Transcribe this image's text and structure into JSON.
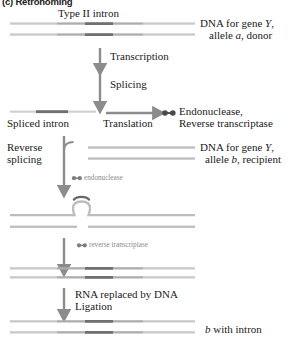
{
  "figure": {
    "panel_label": "(c) Retrohoming",
    "type": "biology-process-diagram"
  },
  "labels": {
    "type_ii_intron": "Type II intron",
    "donor_dna_line1": "DNA for gene Y,",
    "donor_dna_line2": "allele a, donor",
    "transcription": "Transcription",
    "splicing": "Splicing",
    "spliced_intron": "Spliced intron",
    "translation": "Translation",
    "enzymes_line1": "Endonuclease,",
    "enzymes_line2": "Reverse transcriptase",
    "reverse_splicing_line1": "Reverse",
    "reverse_splicing_line2": "splicing",
    "recipient_dna_line1": "DNA for gene Y,",
    "recipient_dna_line2": "allele b, recipient",
    "endonuclease_small": "endonuclease",
    "reverse_transcriptase_small": "reverse transcriptase",
    "rna_replaced_line1": "RNA replaced by DNA",
    "rna_replaced_line2": "Ligation",
    "final_product": "b with intron"
  },
  "italics": {
    "gene_Y": "Y",
    "allele_a": "a",
    "allele_b": "b",
    "final_b": "b"
  },
  "icons": {
    "protein_enzyme": "dumbbell-icon",
    "arrow_down": "arrow-down-icon",
    "arrow_right": "arrow-right-icon",
    "branch_arrow": "curved-branch-arrow-icon",
    "intron_loop": "lariat-loop-icon"
  },
  "colors": {
    "exon_light": "#c9c9c9",
    "exon_mid": "#aaaaaa",
    "intron_dark": "#707070",
    "strand_plain": "#bdbdbd",
    "arrow": "#8c8c8c",
    "text": "#1a1a1a",
    "text_muted": "#8a8a8a",
    "background": "#ffffff"
  },
  "diagram_steps": [
    {
      "step": 1,
      "name": "donor-dna",
      "description": "Double-stranded donor DNA containing Type II intron"
    },
    {
      "step": 2,
      "name": "transcription",
      "description": "Transcription of intron-containing gene"
    },
    {
      "step": 3,
      "name": "splicing",
      "description": "Splicing releases the intron"
    },
    {
      "step": 4,
      "name": "spliced-intron",
      "description": "Free spliced intron RNA"
    },
    {
      "step": 5,
      "name": "translation",
      "description": "Translation produces endonuclease and reverse transcriptase"
    },
    {
      "step": 6,
      "name": "reverse-splicing",
      "description": "Intron reverse-splices into recipient allele b DNA"
    },
    {
      "step": 7,
      "name": "endonuclease-cut",
      "description": "Endonuclease cuts the bottom strand"
    },
    {
      "step": 8,
      "name": "reverse-transcription",
      "description": "Reverse transcriptase copies intron RNA to DNA"
    },
    {
      "step": 9,
      "name": "ligation",
      "description": "RNA replaced by DNA and ligation completes insertion"
    },
    {
      "step": 10,
      "name": "final-product",
      "description": "Allele b now contains the intron"
    }
  ]
}
